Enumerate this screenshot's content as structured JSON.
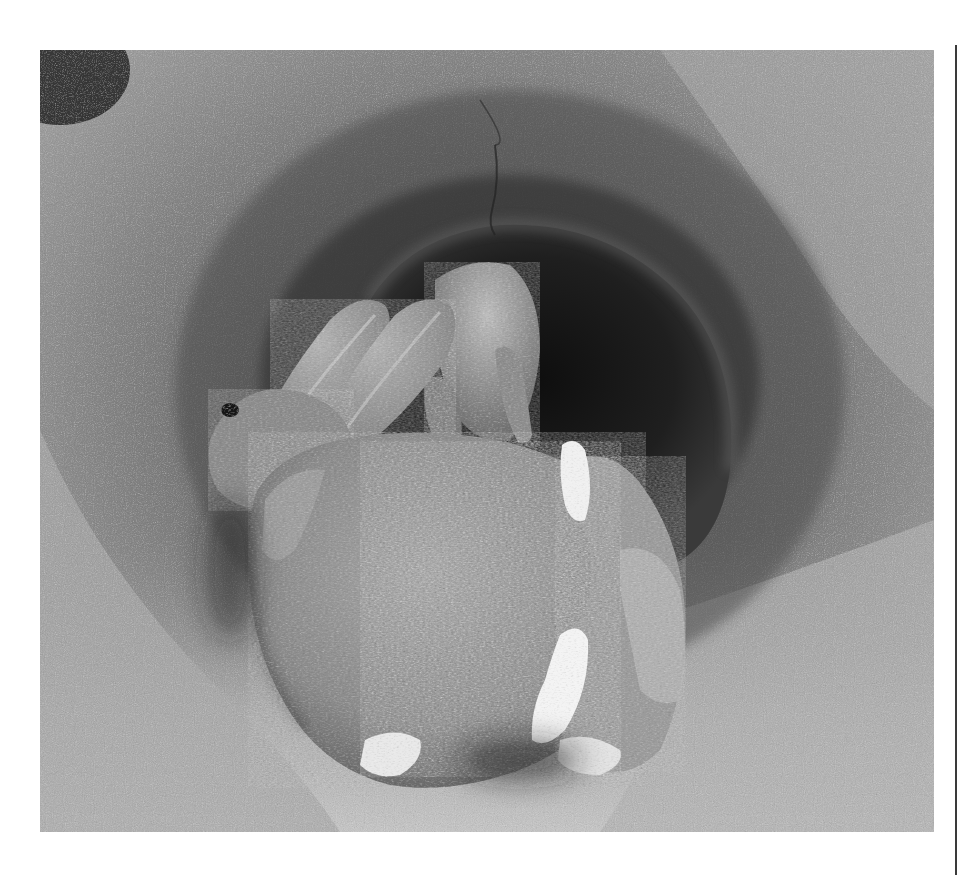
{
  "photo": {
    "subject": "Rabbits huddled at the entrance of a sandy burrow",
    "style": "black-and-white photograph",
    "tones": {
      "sand_light": "#b9b9b9",
      "sand_mid": "#8f8f8f",
      "sand_dark": "#5c5c5c",
      "burrow_shadow": "#1c1c1c",
      "fur_mid": "#9a9a9a",
      "fur_light": "#d6d6d6",
      "tail_white": "#f2f2f2"
    }
  },
  "page": {
    "background": "#ffffff",
    "rule_color": "#3a3a3a"
  }
}
